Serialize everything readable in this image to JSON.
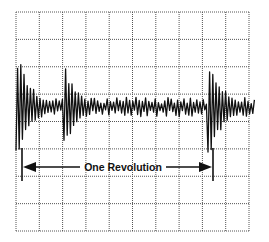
{
  "figure": {
    "annotation_label": "One Revolution",
    "colors": {
      "grid": "#555555",
      "trace": "#111111",
      "background": "#ffffff"
    }
  },
  "grid": {
    "left": 16,
    "top": 12,
    "right": 249,
    "bottom": 231,
    "columns": 10,
    "rows": 8
  },
  "waveform": {
    "baseline_y": 107,
    "x_start": 16,
    "x_end": 255,
    "bursts": [
      {
        "center_x": 19,
        "amplitude": 50,
        "decay": 14
      },
      {
        "center_x": 66,
        "amplitude": 40,
        "decay": 12
      },
      {
        "center_x": 210,
        "amplitude": 50,
        "decay": 14
      }
    ],
    "noise_amplitude": 7
  },
  "revolution_marker": {
    "y": 167,
    "left_x": 22,
    "right_x": 213,
    "tick_top": 148,
    "tick_bottom": 181,
    "text_x": 123
  }
}
